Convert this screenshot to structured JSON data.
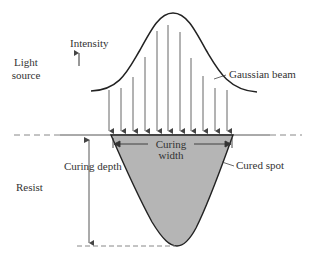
{
  "labels": {
    "light_source_line1": "Light",
    "light_source_line2": "source",
    "intensity": "Intensity",
    "gaussian_beam": "Gaussian beam",
    "curing_width_line1": "Curing",
    "curing_width_line2": "width",
    "cured_spot": "Cured spot",
    "curing_depth": "Curing depth",
    "resist": "Resist"
  },
  "colors": {
    "line": "#333333",
    "arrow": "#555555",
    "cured_fill": "#b5b5b5",
    "dashed": "#888888"
  },
  "beam": {
    "arrow_count": 11
  }
}
